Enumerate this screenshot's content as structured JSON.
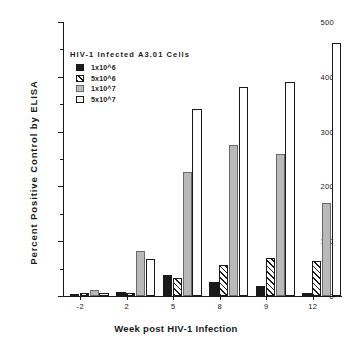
{
  "chart_data": {
    "type": "bar",
    "title": "",
    "xlabel": "Week post HIV-1 Infection",
    "ylabel": "Percent Positive Control by ELISA",
    "categories": [
      "-2",
      "2",
      "5",
      "8",
      "9",
      "12"
    ],
    "ylim": [
      0,
      500
    ],
    "yticks": [
      0,
      100,
      200,
      300,
      400,
      500
    ],
    "yminor_ticks": [
      50,
      150,
      250,
      350,
      450
    ],
    "grid": false,
    "legend_position": "upper-left-inside",
    "legend_title": "HIV-1  Infected  A3.01  Cells",
    "series": [
      {
        "name": "1x10^6",
        "fill": "solid-black",
        "values": [
          4,
          8,
          38,
          25,
          18,
          5
        ]
      },
      {
        "name": "5x10^6",
        "fill": "hatched",
        "values": [
          6,
          5,
          32,
          57,
          69,
          63
        ]
      },
      {
        "name": "1x10^7",
        "fill": "gray",
        "values": [
          11,
          82,
          226,
          275,
          260,
          170
        ]
      },
      {
        "name": "5x10^7",
        "fill": "open-white",
        "values": [
          5,
          68,
          341,
          381,
          391,
          462
        ]
      }
    ]
  },
  "legend": {
    "title": "HIV-1  Infected  A3.01  Cells",
    "items": [
      {
        "label": "1x10^6"
      },
      {
        "label": "5x10^6"
      },
      {
        "label": "1x10^7"
      },
      {
        "label": "5x10^7"
      }
    ]
  },
  "axes": {
    "y_title": "Percent  Positive  Control  by  ELISA",
    "x_title": "Week post HIV-1 Infection",
    "y_tick_labels": [
      "0",
      "100",
      "200",
      "300",
      "400",
      "500"
    ],
    "x_tick_labels": [
      "-2",
      "2",
      "5",
      "8",
      "9",
      "12"
    ]
  }
}
